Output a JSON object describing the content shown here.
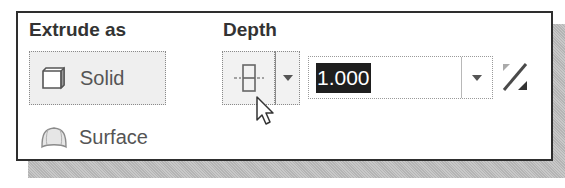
{
  "extrude_as": {
    "title": "Extrude as",
    "options": [
      {
        "label": "Solid",
        "icon": "solid-cube-icon",
        "selected": true
      },
      {
        "label": "Surface",
        "icon": "surface-icon",
        "selected": false
      }
    ]
  },
  "depth": {
    "title": "Depth",
    "type_icon": "symmetric-depth-icon",
    "value": "1.000",
    "value_selected": true,
    "flip_icon": "flip-direction-icon"
  },
  "colors": {
    "panel_border": "#2e2e2e",
    "selection_bg": "#1e1e1e",
    "button_bg": "#efefef",
    "text": "#555555"
  }
}
